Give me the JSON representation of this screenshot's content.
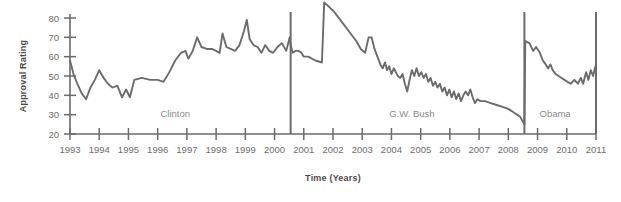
{
  "chart_data": {
    "type": "line",
    "title": "",
    "xlabel": "Time (Years)",
    "ylabel": "Approval Rating",
    "xlim": [
      1993,
      2011
    ],
    "ylim": [
      20,
      90
    ],
    "grid": false,
    "legend": "none",
    "y_ticks": [
      20,
      30,
      40,
      50,
      60,
      70,
      80
    ],
    "x_ticks": [
      1993,
      1994,
      1995,
      1996,
      1997,
      1998,
      1999,
      2000,
      2001,
      2002,
      2003,
      2004,
      2005,
      2006,
      2007,
      2008,
      2009,
      2010,
      2011
    ],
    "line_color": "#6b6b6b",
    "axis_color": "#6b6b6b",
    "annotations": [
      {
        "label": "Clinton",
        "x": 1996.6,
        "y": 29
      },
      {
        "label": "G.W. Bush",
        "x": 2004.7,
        "y": 29
      },
      {
        "label": "Obama",
        "x": 2009.6,
        "y": 29
      }
    ],
    "dividers": [
      {
        "label": "clinton-bush-divider",
        "x": 2000.55
      },
      {
        "label": "bush-obama-divider",
        "x": 2008.55
      },
      {
        "label": "right-boundary",
        "x": 2011.0
      }
    ],
    "series": [
      {
        "name": "Presidential Approval Rating",
        "points": [
          [
            1993.0,
            58
          ],
          [
            1993.12,
            51
          ],
          [
            1993.25,
            46
          ],
          [
            1993.4,
            41
          ],
          [
            1993.55,
            38
          ],
          [
            1993.7,
            44
          ],
          [
            1993.85,
            48
          ],
          [
            1994.0,
            53
          ],
          [
            1994.15,
            49
          ],
          [
            1994.3,
            46
          ],
          [
            1994.45,
            44
          ],
          [
            1994.62,
            45
          ],
          [
            1994.78,
            39
          ],
          [
            1994.92,
            43
          ],
          [
            1995.05,
            39
          ],
          [
            1995.2,
            48
          ],
          [
            1995.45,
            49
          ],
          [
            1995.75,
            48
          ],
          [
            1996.0,
            48
          ],
          [
            1996.2,
            47
          ],
          [
            1996.4,
            52
          ],
          [
            1996.6,
            58
          ],
          [
            1996.8,
            62
          ],
          [
            1996.95,
            63
          ],
          [
            1997.05,
            59
          ],
          [
            1997.2,
            63
          ],
          [
            1997.35,
            70
          ],
          [
            1997.5,
            65
          ],
          [
            1997.68,
            64
          ],
          [
            1997.85,
            64
          ],
          [
            1998.0,
            63
          ],
          [
            1998.12,
            62
          ],
          [
            1998.22,
            72
          ],
          [
            1998.35,
            65
          ],
          [
            1998.5,
            64
          ],
          [
            1998.65,
            63
          ],
          [
            1998.8,
            66
          ],
          [
            1998.95,
            73
          ],
          [
            1999.05,
            79
          ],
          [
            1999.15,
            69
          ],
          [
            1999.28,
            66
          ],
          [
            1999.42,
            65
          ],
          [
            1999.55,
            62
          ],
          [
            1999.68,
            66
          ],
          [
            1999.82,
            63
          ],
          [
            1999.95,
            62
          ],
          [
            2000.1,
            65
          ],
          [
            2000.25,
            67
          ],
          [
            2000.4,
            63
          ],
          [
            2000.52,
            70
          ],
          [
            2000.55,
            66
          ],
          [
            2000.62,
            62
          ],
          [
            2000.72,
            63
          ],
          [
            2000.82,
            63
          ],
          [
            2000.92,
            62
          ],
          [
            2001.0,
            60
          ],
          [
            2001.15,
            60
          ],
          [
            2001.4,
            58
          ],
          [
            2001.62,
            57
          ],
          [
            2001.7,
            88
          ],
          [
            2001.85,
            86
          ],
          [
            2002.05,
            83
          ],
          [
            2002.3,
            78
          ],
          [
            2002.55,
            73
          ],
          [
            2002.8,
            68
          ],
          [
            2002.95,
            64
          ],
          [
            2003.1,
            62
          ],
          [
            2003.22,
            70
          ],
          [
            2003.32,
            70
          ],
          [
            2003.42,
            64
          ],
          [
            2003.52,
            60
          ],
          [
            2003.62,
            56
          ],
          [
            2003.7,
            54
          ],
          [
            2003.78,
            57
          ],
          [
            2003.85,
            53
          ],
          [
            2003.92,
            55
          ],
          [
            2004.0,
            51
          ],
          [
            2004.08,
            54
          ],
          [
            2004.15,
            52
          ],
          [
            2004.22,
            50
          ],
          [
            2004.3,
            49
          ],
          [
            2004.38,
            51
          ],
          [
            2004.46,
            46
          ],
          [
            2004.54,
            42
          ],
          [
            2004.62,
            48
          ],
          [
            2004.7,
            53
          ],
          [
            2004.78,
            50
          ],
          [
            2004.86,
            54
          ],
          [
            2004.94,
            50
          ],
          [
            2005.02,
            52
          ],
          [
            2005.1,
            49
          ],
          [
            2005.18,
            51
          ],
          [
            2005.26,
            47
          ],
          [
            2005.34,
            49
          ],
          [
            2005.42,
            45
          ],
          [
            2005.5,
            47
          ],
          [
            2005.58,
            44
          ],
          [
            2005.66,
            46
          ],
          [
            2005.74,
            42
          ],
          [
            2005.82,
            44
          ],
          [
            2005.9,
            40
          ],
          [
            2005.98,
            43
          ],
          [
            2006.06,
            39
          ],
          [
            2006.14,
            42
          ],
          [
            2006.22,
            38
          ],
          [
            2006.3,
            41
          ],
          [
            2006.38,
            37
          ],
          [
            2006.46,
            40
          ],
          [
            2006.54,
            42
          ],
          [
            2006.62,
            40
          ],
          [
            2006.7,
            43
          ],
          [
            2006.78,
            39
          ],
          [
            2006.86,
            36
          ],
          [
            2006.94,
            38
          ],
          [
            2007.05,
            37
          ],
          [
            2007.2,
            37
          ],
          [
            2007.4,
            36
          ],
          [
            2007.6,
            35
          ],
          [
            2007.8,
            34
          ],
          [
            2008.0,
            33
          ],
          [
            2008.2,
            31
          ],
          [
            2008.4,
            29
          ],
          [
            2008.55,
            25
          ],
          [
            2008.58,
            68
          ],
          [
            2008.72,
            67
          ],
          [
            2008.85,
            63
          ],
          [
            2008.95,
            65
          ],
          [
            2009.08,
            62
          ],
          [
            2009.18,
            58
          ],
          [
            2009.28,
            56
          ],
          [
            2009.36,
            54
          ],
          [
            2009.44,
            56
          ],
          [
            2009.52,
            53
          ],
          [
            2009.62,
            51
          ],
          [
            2009.72,
            50
          ],
          [
            2009.82,
            49
          ],
          [
            2009.92,
            48
          ],
          [
            2010.02,
            47
          ],
          [
            2010.14,
            46
          ],
          [
            2010.26,
            48
          ],
          [
            2010.38,
            46
          ],
          [
            2010.48,
            49
          ],
          [
            2010.56,
            46
          ],
          [
            2010.66,
            52
          ],
          [
            2010.74,
            48
          ],
          [
            2010.82,
            53
          ],
          [
            2010.9,
            50
          ],
          [
            2010.98,
            55
          ]
        ]
      }
    ]
  }
}
